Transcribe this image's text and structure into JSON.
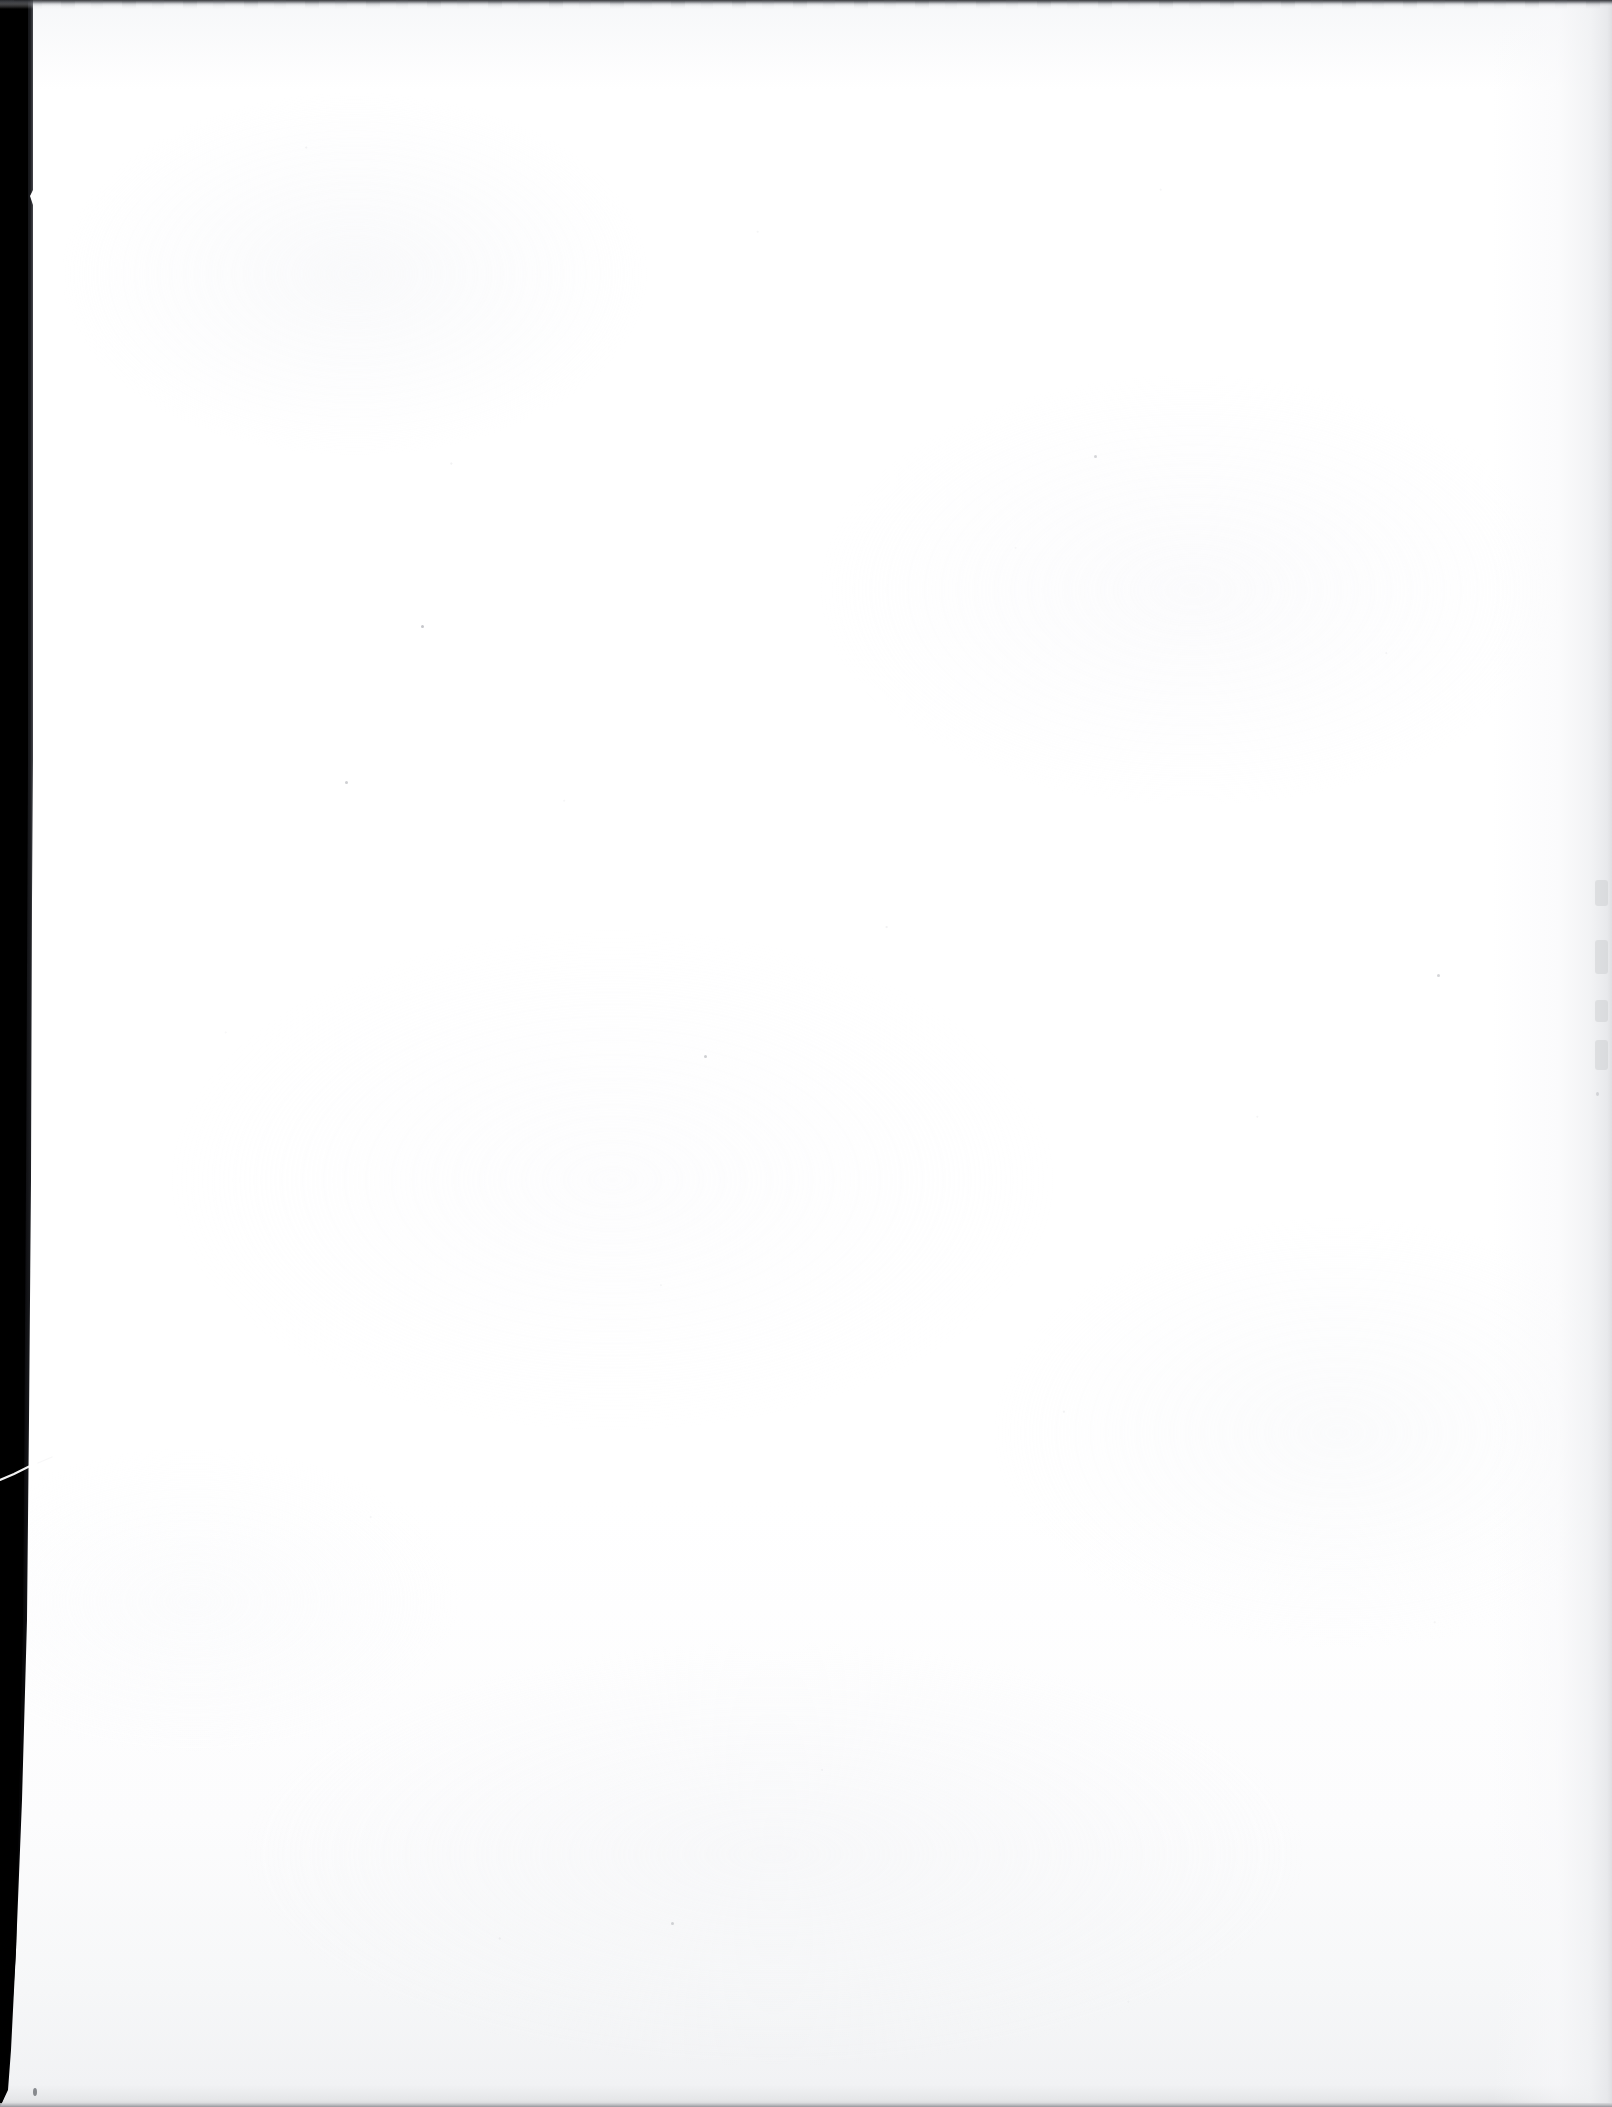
{
  "document": {
    "kind": "scanned-page-image",
    "page_type": "blank-page",
    "visible_text": "",
    "printed_content": "none",
    "orientation": "portrait",
    "width_px": 1612,
    "height_px": 2107
  },
  "colors": {
    "paper_white": "#ffffff",
    "paper_shadow": "#f1f2f4",
    "paper_bottom_gray": "#e5e6e8",
    "bezel_black": "#0a0a0c",
    "top_band_dark": "#26272b",
    "bottom_rule_gray": "#96979c",
    "right_edge_gray": "#dedfe2",
    "speckle_gray": "#b0b2b8"
  },
  "artifacts": {
    "left_bezel": {
      "name": "scanner-bezel-strip",
      "position": "left",
      "top_width_px": 33,
      "bottom_width_px": 10,
      "color": "#0a0a0c",
      "description": "Solid black scanner gutter tapering from top to bottom"
    },
    "top_band": {
      "name": "top-edge-band",
      "position": "top",
      "height_px": 3,
      "color": "#26272b",
      "description": "Thin dark band along the top edge of the scan"
    },
    "bottom_rule": {
      "name": "bottom-edge-rule",
      "position": "bottom",
      "height_px": 4,
      "color": "#96979c",
      "description": "Thin gray line at the very bottom edge"
    },
    "right_shade": {
      "name": "right-margin-shading",
      "position": "right",
      "width_px": 120,
      "color": "#dedfe2",
      "description": "Soft gray gradient along the right page margin"
    },
    "scratch": {
      "name": "diagonal-scratch",
      "position": "left-bezel",
      "approx_y_px": 1468,
      "color": "#ffffff",
      "description": "Thin white diagonal streak crossing the black left strip"
    },
    "texture": {
      "name": "paper-grain",
      "description": "Faint fiber speckle and mottling across the sheet"
    }
  }
}
